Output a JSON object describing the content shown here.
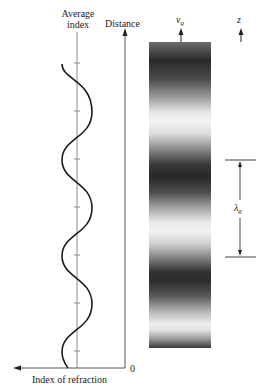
{
  "diagram": {
    "type": "index-of-refraction-grating",
    "left_plot": {
      "top_label_line1": "Average",
      "top_label_line2": "index",
      "vertical_axis_label": "Distance",
      "horizontal_axis_label": "Index of refraction",
      "origin_label": "0",
      "curve": "sinusoid",
      "periods_shown": 3
    },
    "grating": {
      "velocity_label": "v",
      "velocity_subscript": "g",
      "direction_label": "z",
      "wavelength_label": "λ",
      "wavelength_subscript": "g",
      "dark_band_count": 4
    },
    "colors": {
      "ink": "#1a1a1a",
      "axis_gray": "#777777",
      "dark_band": "#2a2a2a",
      "light_band": "#f4f4f4"
    }
  }
}
